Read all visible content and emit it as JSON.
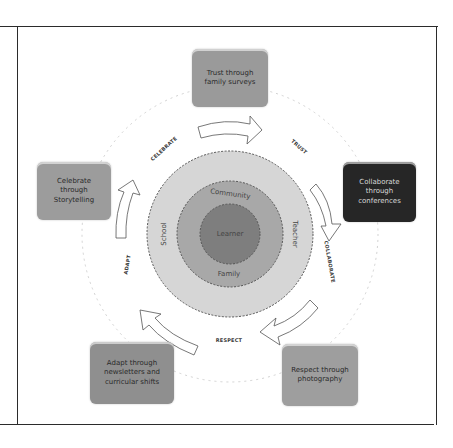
{
  "diagram": {
    "center": {
      "label": "Learner"
    },
    "rings": {
      "middle": {
        "top_label": "Community",
        "bottom_label": "Family"
      },
      "outer": {
        "left_label": "School",
        "right_label": "Teacher"
      }
    },
    "phases": [
      {
        "id": "celebrate",
        "label": "CELEBRATE"
      },
      {
        "id": "trust",
        "label": "TRUST"
      },
      {
        "id": "collaborate",
        "label": "COLLABORATE"
      },
      {
        "id": "respect",
        "label": "RESPECT"
      },
      {
        "id": "adapt",
        "label": "ADAPT"
      }
    ],
    "boxes": [
      {
        "id": "trust",
        "text": "Trust through family surveys",
        "fill": "#9a9a9a"
      },
      {
        "id": "collaborate",
        "text": "Collaborate through conferences",
        "fill": "#262626"
      },
      {
        "id": "respect",
        "text": "Respect through photography",
        "fill": "#9e9e9e"
      },
      {
        "id": "adapt",
        "text": "Adapt through newsletters and curricular shifts",
        "fill": "#8f8f8f"
      },
      {
        "id": "celebrate",
        "text": "Celebrate through Storytelling",
        "fill": "#9c9c9c"
      }
    ],
    "colors": {
      "outer_ring": "#d6d6d6",
      "middle_ring": "#a8a8a8",
      "inner_circle": "#7e7e7e",
      "dashed_stroke": "#555555",
      "frame": "#2b2b2b"
    }
  }
}
